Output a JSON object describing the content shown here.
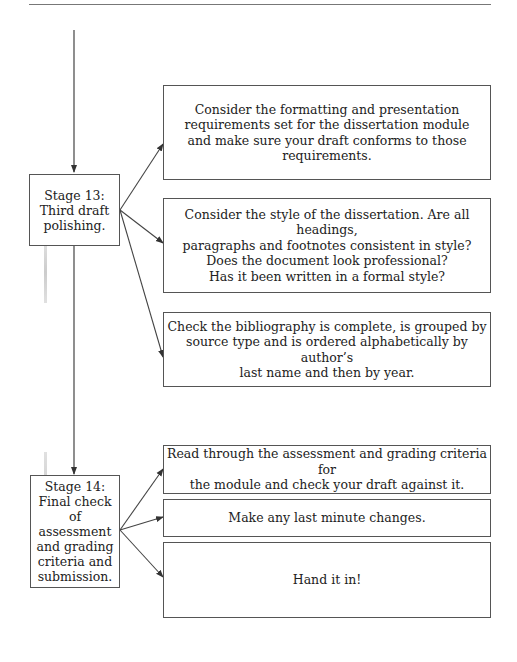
{
  "diagram": {
    "stages": [
      {
        "id": "stage-13",
        "label": "Stage 13: Third draft polishing.",
        "lines": [
          "Stage 13:",
          "Third draft",
          "polishing."
        ],
        "tasks": [
          {
            "lines": [
              "Consider the formatting and presentation",
              "requirements set for the dissertation module",
              "and make sure your draft conforms to those",
              "requirements."
            ]
          },
          {
            "lines": [
              "Consider the style of the dissertation. Are all headings,",
              "paragraphs and footnotes consistent in style?",
              "Does the document look professional?",
              "Has it been written in a formal style?"
            ]
          },
          {
            "lines": [
              "Check the bibliography is complete, is grouped by",
              "source type and is ordered alphabetically by author’s",
              "last name and then by year."
            ]
          }
        ]
      },
      {
        "id": "stage-14",
        "label": "Stage 14: Final check of assessment and grading criteria and submission.",
        "lines": [
          "Stage 14:",
          "Final check",
          "of assessment",
          "and grading",
          "criteria and",
          "submission."
        ],
        "tasks": [
          {
            "lines": [
              "Read through the assessment and grading criteria for",
              "the module and check your draft against it."
            ]
          },
          {
            "lines": [
              "Make any last minute changes."
            ]
          },
          {
            "lines": [
              "Hand it in!"
            ]
          }
        ]
      }
    ],
    "colors": {
      "line": "#444444",
      "border": "#555555",
      "text": "#222222"
    }
  }
}
